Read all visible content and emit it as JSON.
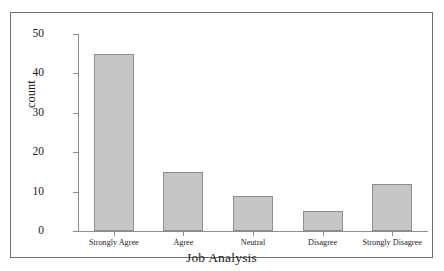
{
  "chart_data": {
    "type": "bar",
    "title": "",
    "xlabel": "Job Analysis",
    "ylabel": "count",
    "categories": [
      "Strongly Agree",
      "Agree",
      "Neutral",
      "Disagree",
      "Strongly Disagree"
    ],
    "values": [
      45,
      15,
      9,
      5,
      12
    ],
    "ylim": [
      0,
      50
    ],
    "yticks": [
      0,
      10,
      20,
      30,
      40,
      50
    ],
    "ytick_labels": [
      "0",
      "10",
      "20",
      "30",
      "40",
      "50"
    ],
    "grid": false,
    "legend": null,
    "bar_color": "#c6c6c6",
    "bar_edge_color": "#8e8e90",
    "axis_color": "#8d8d90",
    "text_color": "#1c1c1c",
    "frame_color": "#6f6f72",
    "background": "#ffffff"
  }
}
